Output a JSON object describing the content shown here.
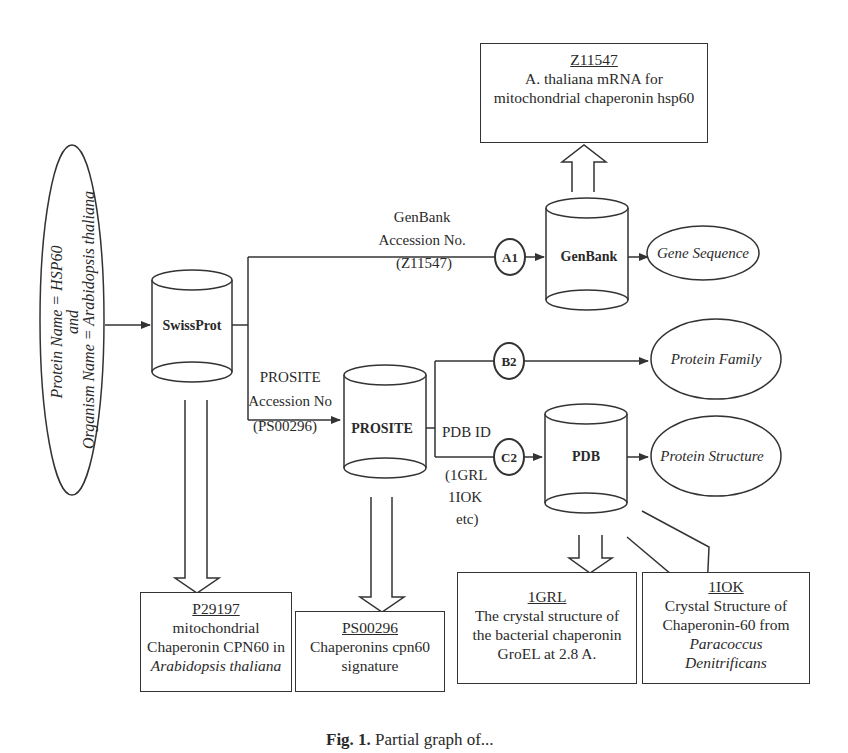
{
  "query": {
    "line1": "Protein Name = HSP60",
    "line2": "and",
    "line3": "Organism Name = Arabidopsis thaliana"
  },
  "databases": {
    "swissprot": "SwissProt",
    "prosite": "PROSITE",
    "genbank": "GenBank",
    "pdb": "PDB"
  },
  "links": {
    "genbank_label_1": "GenBank",
    "genbank_label_2": "Accession No.",
    "genbank_label_3": "(Z11547)",
    "prosite_label_1": "PROSITE",
    "prosite_label_2": "Accession No",
    "prosite_label_3": "(PS00296)",
    "pdb_label_1": "PDB ID",
    "pdb_label_2": "(1GRL",
    "pdb_label_3": "1IOK",
    "pdb_label_4": "etc)"
  },
  "nodes": {
    "a1": "A1",
    "b2": "B2",
    "c2": "C2"
  },
  "outputs": {
    "gene_sequence": "Gene Sequence",
    "protein_family": "Protein Family",
    "protein_structure": "Protein Structure"
  },
  "records": {
    "z11547": {
      "id": "Z11547",
      "line1": "A. thaliana mRNA for",
      "line2": "mitochondrial chaperonin hsp60"
    },
    "p29197": {
      "id": "P29197",
      "line1": "mitochondrial",
      "line2": "Chaperonin CPN60 in",
      "line3": "Arabidopsis thaliana"
    },
    "ps00296": {
      "id": "PS00296",
      "line1": "Chaperonins cpn60",
      "line2": "signature"
    },
    "1grl": {
      "id": "1GRL",
      "line1": "The crystal structure of",
      "line2": "the bacterial chaperonin",
      "line3": "GroEL at 2.8 A."
    },
    "1iok": {
      "id": "1IOK",
      "line1": "Crystal Structure of",
      "line2": "Chaperonin-60 from",
      "line3": "Paracoccus",
      "line4": "Denitrificans"
    }
  },
  "caption": {
    "fig": "Fig. 1.",
    "text": "Partial graph of..."
  }
}
